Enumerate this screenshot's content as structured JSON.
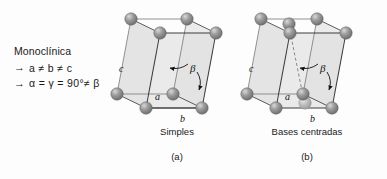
{
  "figure": {
    "system_name": "Monoclínica",
    "relations": [
      {
        "arrow": "→",
        "text": "a ≠ b ≠ c"
      },
      {
        "arrow": "→",
        "text": "α = γ = 90°≠ β"
      }
    ],
    "background_color": "#fdfdfd",
    "atom_color": "#8a8a8a",
    "atom_highlight_color": "#c9c9c9",
    "face_fill_color": "#e3e3e3",
    "edge_color": "#4a4a4a",
    "text_color": "#1a1a1a"
  },
  "cells": [
    {
      "id": "simple-monoclinic",
      "caption": "Simples",
      "index": "(a)",
      "axis_labels": {
        "a": "a",
        "b": "b",
        "c": "c"
      },
      "angle_label": "β",
      "lattice_points": 8,
      "extra_points": 0
    },
    {
      "id": "base-centered-monoclinic",
      "caption": "Bases centradas",
      "index": "(b)",
      "axis_labels": {
        "a": "a",
        "b": "b",
        "c": "c"
      },
      "angle_label": "β",
      "lattice_points": 8,
      "extra_points": 2
    }
  ]
}
